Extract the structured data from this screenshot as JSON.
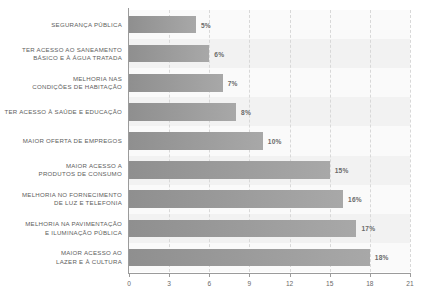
{
  "chart_data": {
    "type": "bar",
    "orientation": "horizontal",
    "title": "",
    "subtitle": "",
    "xlabel": "",
    "ylabel": "",
    "xlim": [
      0,
      21
    ],
    "xticks": [
      "0",
      "3",
      "6",
      "9",
      "12",
      "15",
      "18",
      "21"
    ],
    "grid": "vertical-dashed",
    "legend": "none",
    "categories": [
      "SEGURANÇA PÚBLICA",
      "TER ACESSO AO SANEAMENTO\nBÁSICO E À ÁGUA TRATADA",
      "MELHORIA NAS\nCONDIÇÕES DE HABITAÇÃO",
      "TER ACESSO À SAÚDE E EDUCAÇÃO",
      "MAIOR OFERTA DE EMPREGOS",
      "MAIOR ACESSO A\nPRODUTOS DE CONSUMO",
      "MELHORIA NO FORNECIMENTO\nDE LUZ E TELEFONIA",
      "MELHORIA NA PAVIMENTAÇÃO\nE ILUMINAÇÃO PÚBLICA",
      "MAIOR ACESSO AO\nLAZER E À CULTURA"
    ],
    "values": [
      5,
      6,
      7,
      8,
      10,
      15,
      16,
      17,
      18
    ],
    "value_labels": [
      "5%",
      "6%",
      "7%",
      "8%",
      "10%",
      "15%",
      "16%",
      "17%",
      "18%"
    ],
    "colors": {
      "bar_dark": "#8f8f8f",
      "bar_light": "#a8a8a8",
      "plot_background": "#f2f2f2",
      "row_band": "#fafafa",
      "gridline": "#d8d8d8",
      "axis": "#9b9b9b",
      "label_text": "#5d5d5d",
      "value_text": "#6a6a6a"
    }
  }
}
